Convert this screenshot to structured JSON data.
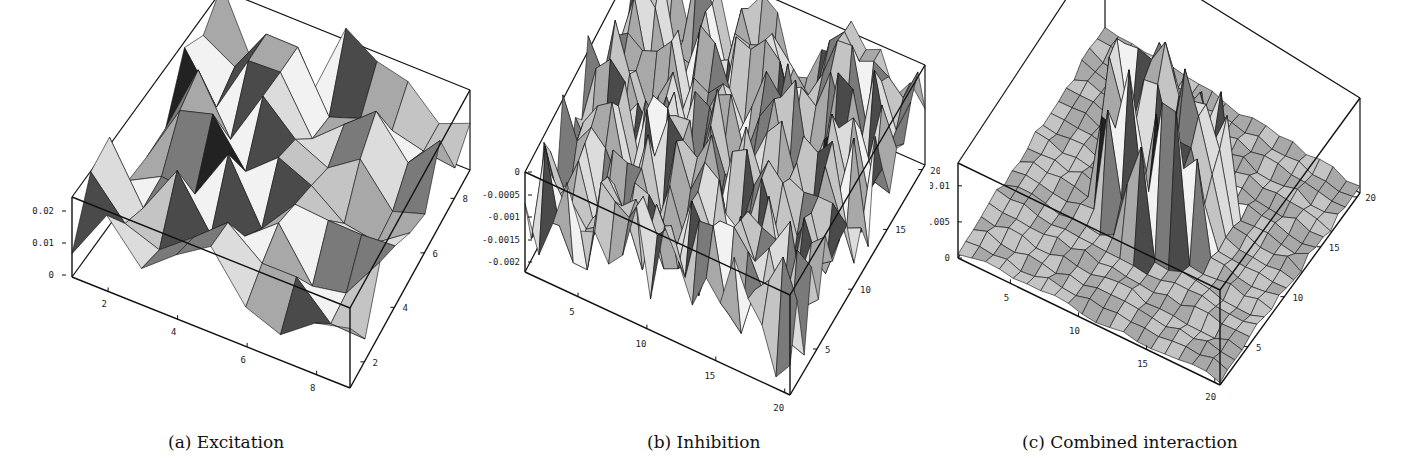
{
  "figure": {
    "panels": [
      {
        "id": "a",
        "caption": "(a) Excitation"
      },
      {
        "id": "b",
        "caption": "(b) Inhibition"
      },
      {
        "id": "c",
        "caption": "(c) Combined interaction"
      }
    ]
  },
  "chart_data": [
    {
      "type": "surface3d",
      "title": "(a) Excitation",
      "x_ticks": [
        "2",
        "4",
        "6",
        "8"
      ],
      "y_ticks": [
        "2",
        "4",
        "6",
        "8"
      ],
      "z_ticks": [
        "0",
        "0.01",
        "0.02"
      ],
      "x_range": [
        1,
        9
      ],
      "y_range": [
        1,
        9
      ],
      "zlim": [
        0,
        0.025
      ],
      "description": "Irregular faceted surface on a 9x9 grid; values fluctuate between about 0 and 0.025 across the whole domain",
      "grid_size": 9
    },
    {
      "type": "surface3d",
      "title": "(b) Inhibition",
      "x_ticks": [
        "5",
        "10",
        "15",
        "20"
      ],
      "y_ticks": [
        "5",
        "10",
        "15",
        "20"
      ],
      "z_ticks": [
        "0",
        "-0.0005",
        "-0.001",
        "-0.0015",
        "-0.002"
      ],
      "x_range": [
        1,
        20
      ],
      "y_range": [
        1,
        20
      ],
      "zlim": [
        -0.0022,
        0
      ],
      "description": "Dense spiky surface on a 20x20 grid; values range from about -0.0022 to 0",
      "grid_size": 20
    },
    {
      "type": "surface3d",
      "title": "(c) Combined interaction",
      "x_ticks": [
        "5",
        "10",
        "15",
        "20"
      ],
      "y_ticks": [
        "5",
        "10",
        "15",
        "20"
      ],
      "z_ticks": [
        "0",
        "0.005",
        "0.01"
      ],
      "x_range": [
        1,
        20
      ],
      "y_range": [
        1,
        20
      ],
      "zlim": [
        -0.001,
        0.012
      ],
      "description": "Mostly flat surface near 0 with a tall cluster of spikes (up to ~0.012) in the center region around x=8-13, y=8-13",
      "grid_size": 20
    }
  ]
}
